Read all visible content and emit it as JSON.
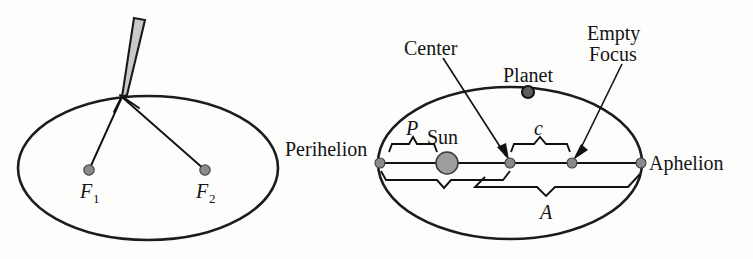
{
  "figure": {
    "background_color": "#fdfdfc",
    "ink_color": "#141414"
  },
  "left_panel": {
    "name": "ellipse-string-construction",
    "ellipse": {
      "cx": 148,
      "cy": 168,
      "rx": 130,
      "ry": 72
    },
    "pencil": {
      "tip_x": 122,
      "tip_y": 97,
      "top_left_x": 134,
      "top_left_y": 18,
      "top_right_x": 145,
      "top_right_y": 20,
      "fill_color": "#c9c9c9"
    },
    "focus_1": {
      "label": "F",
      "subscript": "1",
      "x": 89,
      "y": 170,
      "label_x": 80,
      "label_y": 196
    },
    "focus_2": {
      "label": "F",
      "subscript": "2",
      "x": 205,
      "y": 170,
      "label_x": 196,
      "label_y": 196
    },
    "string_segments": [
      {
        "from_x": 122,
        "from_y": 97,
        "to_x": 89,
        "to_y": 170
      },
      {
        "from_x": 122,
        "from_y": 97,
        "to_x": 205,
        "to_y": 170
      }
    ]
  },
  "right_panel": {
    "name": "planetary-orbit-diagram",
    "ellipse": {
      "cx": 510,
      "cy": 163,
      "rx": 132,
      "ry": 76
    },
    "major_axis": {
      "x1": 380,
      "y1": 163,
      "x2": 641,
      "y2": 163
    },
    "labels": {
      "perihelion": "Perihelion",
      "aphelion": "Aphelion",
      "center": "Center",
      "planet": "Planet",
      "empty_line1": "Empty",
      "empty_line2": "Focus",
      "sun": "Sun",
      "brace_p": "P",
      "brace_c": "c",
      "brace_a": "A"
    },
    "points": {
      "perihelion": {
        "x": 380,
        "y": 163
      },
      "aphelion": {
        "x": 641,
        "y": 163
      },
      "center": {
        "x": 510,
        "y": 163
      },
      "empty_focus": {
        "x": 572,
        "y": 163
      },
      "sun": {
        "x": 447,
        "y": 163,
        "r": 11
      },
      "planet": {
        "x": 528,
        "y": 92,
        "r": 7
      }
    },
    "leaders": [
      {
        "name": "center-leader",
        "x1": 443,
        "y1": 58,
        "x2": 506,
        "y2": 156
      },
      {
        "name": "empty-focus-leader",
        "x1": 622,
        "y1": 64,
        "x2": 577,
        "y2": 156
      }
    ],
    "braces": {
      "p": {
        "x_start": 389,
        "x_end": 437,
        "y": 152,
        "peak_y": 139,
        "label_x": 412,
        "label_y": 133
      },
      "c": {
        "x_start": 511,
        "x_end": 570,
        "y": 152,
        "peak_y": 139,
        "label_x": 539,
        "label_y": 133
      },
      "lower_unlabeled": {
        "x_start": 381,
        "x_end": 510,
        "y": 172,
        "notch_y": 187
      },
      "a": {
        "x_start": 483,
        "x_end": 640,
        "y": 181,
        "notch_y": 195,
        "label_x": 546,
        "label_y": 218
      }
    }
  },
  "text_positions": {
    "perihelion_x": 285,
    "perihelion_y": 155,
    "aphelion_x": 650,
    "aphelion_y": 170,
    "center_x": 404,
    "center_y": 54,
    "planet_x": 503,
    "planet_y": 81,
    "empty_x": 587,
    "empty_y": 39,
    "focus_x": 589,
    "focus_y": 60,
    "sun_x": 427,
    "sun_y": 143
  }
}
